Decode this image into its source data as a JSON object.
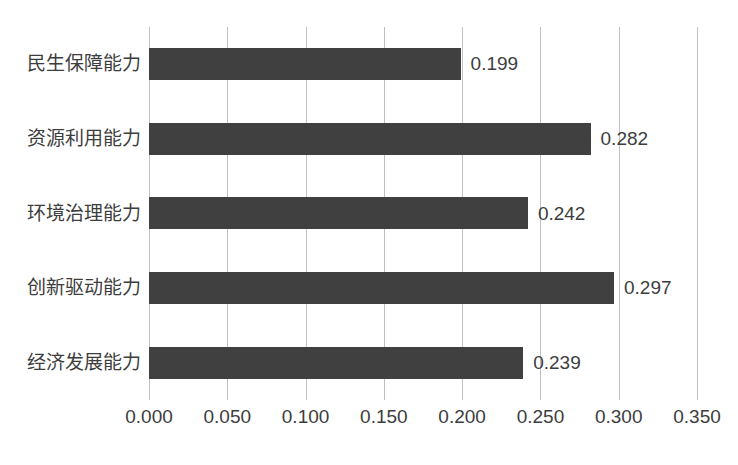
{
  "chart_data": {
    "type": "bar",
    "orientation": "horizontal",
    "title": "",
    "xlabel": "",
    "ylabel": "",
    "categories": [
      "民生保障能力",
      "资源利用能力",
      "环境治理能力",
      "创新驱动能力",
      "经济发展能力"
    ],
    "values": [
      0.199,
      0.282,
      0.242,
      0.297,
      0.239
    ],
    "value_labels": [
      "0.199",
      "0.282",
      "0.242",
      "0.297",
      "0.239"
    ],
    "xlim": [
      0.0,
      0.35
    ],
    "xticks": [
      0.0,
      0.05,
      0.1,
      0.15,
      0.2,
      0.25,
      0.3,
      0.35
    ],
    "xtick_labels": [
      "0.000",
      "0.050",
      "0.100",
      "0.150",
      "0.200",
      "0.250",
      "0.300",
      "0.350"
    ],
    "grid": "vertical",
    "legend": "none",
    "bar_color": "#404040",
    "gridline_color": "#c0c0c0",
    "text_color": "#3d3d3d",
    "background_color": "#ffffff"
  }
}
